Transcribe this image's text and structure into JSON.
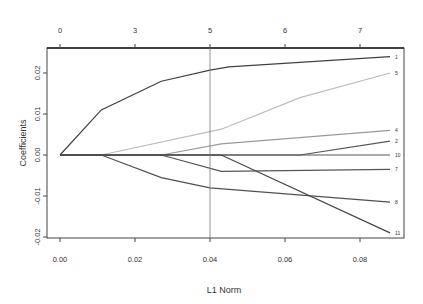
{
  "chart_data": {
    "type": "line",
    "title": "",
    "xlabel": "L1 Norm",
    "ylabel": "Coefficients",
    "xlim": [
      -0.0035,
      0.092
    ],
    "ylim": [
      -0.0202,
      0.0262
    ],
    "x_ticks": [
      0.0,
      0.02,
      0.04,
      0.06,
      0.08
    ],
    "x_tick_labels": [
      "0.00",
      "0.02",
      "0.04",
      "0.06",
      "0.08"
    ],
    "y_ticks": [
      -0.02,
      -0.01,
      0.0,
      0.01,
      0.02
    ],
    "y_tick_labels": [
      "-0.02",
      "-0.01",
      "0.00",
      "0.01",
      "0.02"
    ],
    "top_axis": {
      "positions": [
        0.0,
        0.02,
        0.04,
        0.06,
        0.08
      ],
      "labels": [
        "0",
        "3",
        "5",
        "6",
        "7"
      ]
    },
    "vline": 0.04,
    "grid": false,
    "legend": "none",
    "series": [
      {
        "name": "1",
        "color": "#404040",
        "x": [
          0,
          0.011,
          0.027,
          0.04,
          0.045,
          0.088
        ],
        "y": [
          0,
          0.011,
          0.018,
          0.0207,
          0.0215,
          0.024
        ]
      },
      {
        "name": "5",
        "color": "#bdbdbd",
        "x": [
          0,
          0.011,
          0.043,
          0.064,
          0.088
        ],
        "y": [
          0,
          0,
          0.0063,
          0.014,
          0.02
        ]
      },
      {
        "name": "4",
        "color": "#9a9a9a",
        "x": [
          0,
          0.027,
          0.043,
          0.088
        ],
        "y": [
          0,
          0,
          0.0027,
          0.006
        ]
      },
      {
        "name": "2",
        "color": "#555555",
        "x": [
          0,
          0.064,
          0.088
        ],
        "y": [
          0,
          0,
          0.0034
        ]
      },
      {
        "name": "10",
        "color": "#555555",
        "x": [
          0,
          0.088
        ],
        "y": [
          0,
          0
        ]
      },
      {
        "name": "7",
        "color": "#555555",
        "x": [
          0,
          0.027,
          0.043,
          0.088
        ],
        "y": [
          0,
          0,
          -0.004,
          -0.0035
        ]
      },
      {
        "name": "8",
        "color": "#505050",
        "x": [
          0,
          0.011,
          0.027,
          0.04,
          0.088
        ],
        "y": [
          0,
          0,
          -0.0055,
          -0.008,
          -0.0115
        ]
      },
      {
        "name": "11",
        "color": "#454545",
        "x": [
          0,
          0.043,
          0.088
        ],
        "y": [
          0,
          0,
          -0.019
        ]
      }
    ]
  }
}
